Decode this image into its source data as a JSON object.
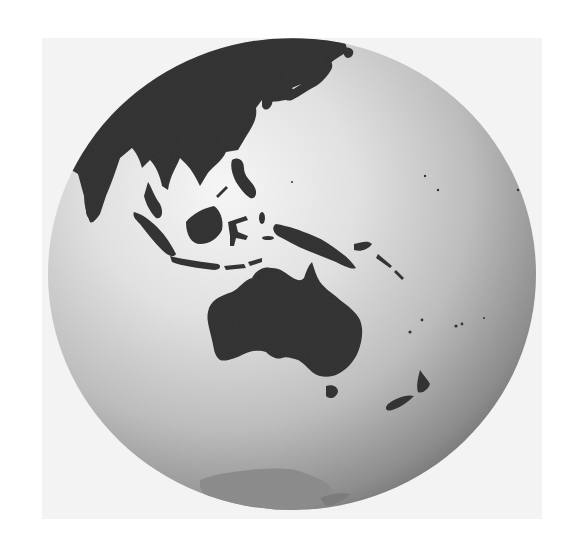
{
  "image": {
    "subject": "Globe viewed over the Asia-Pacific region",
    "style": "grayscale shaded relief",
    "regions_visible": [
      "East Asia",
      "Japan",
      "Southeast Asia",
      "Philippines",
      "Indonesia",
      "New Guinea",
      "Australia",
      "Tasmania",
      "New Zealand",
      "Antarctica",
      "Pacific islands"
    ]
  },
  "colors": {
    "page_background": "#ffffff",
    "backdrop": "#f3f3f3",
    "ocean_highlight": "#f7f7f7",
    "ocean_mid": "#c9c9c9",
    "ocean_shadow": "#6e6e6e",
    "land": "#2f2f2f",
    "antarctica": "#8a8a8a"
  }
}
